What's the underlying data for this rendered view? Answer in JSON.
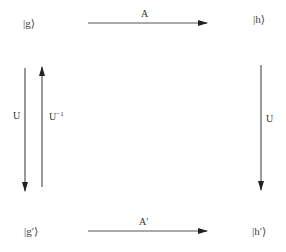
{
  "diagram": {
    "nodes": {
      "top_left": "|g⟩",
      "top_right": "|h⟩",
      "bottom_left": "|g′⟩",
      "bottom_right": "|h′⟩"
    },
    "arrows": {
      "top": {
        "label": "A",
        "from": "|g⟩",
        "to": "|h⟩"
      },
      "bottom": {
        "label": "A′",
        "from": "|g′⟩",
        "to": "|h′⟩"
      },
      "left_down": {
        "label": "U",
        "from": "|g⟩",
        "to": "|g′⟩"
      },
      "left_up": {
        "label_base": "U",
        "label_sup": "−1",
        "from": "|g′⟩",
        "to": "|g⟩"
      },
      "right_down": {
        "label": "U",
        "from": "|h⟩",
        "to": "|h′⟩"
      }
    },
    "colors": {
      "line": "#333333",
      "text": "#444444"
    }
  }
}
